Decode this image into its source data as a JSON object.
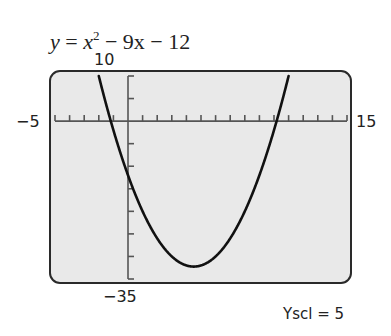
{
  "chart_data": {
    "type": "line",
    "equation": {
      "lhs": "y",
      "x_term": "x",
      "exponent": "2",
      "rest": " − 9x − 12"
    },
    "function": "x^2 - 9x - 12",
    "xlim": [
      -5,
      15
    ],
    "ylim": [
      -35,
      10
    ],
    "xscl": 1,
    "yscl": 5,
    "labels": {
      "xmin": "−5",
      "xmax": "15",
      "ymax": "10",
      "ymin": "−35",
      "yscl": "Yscl = 5"
    },
    "grid": false,
    "vertex": [
      4.5,
      -32.25
    ],
    "y_intercept": -12,
    "x_intercepts": [
      -1.18,
      10.18
    ],
    "series": [
      {
        "name": "y = x^2 - 9x - 12",
        "x": [
          -2,
          -1,
          0,
          1,
          2,
          3,
          4,
          4.5,
          5,
          6,
          7,
          8,
          9,
          10,
          11
        ],
        "y": [
          10,
          -2,
          -12,
          -20,
          -26,
          -30,
          -32,
          -32.25,
          -32,
          -30,
          -26,
          -20,
          -12,
          -2,
          10
        ]
      }
    ]
  },
  "colors": {
    "screen": "#e9e9e9",
    "frame": "#2a2a2a",
    "curve": "#111111",
    "axis": "#555555"
  }
}
